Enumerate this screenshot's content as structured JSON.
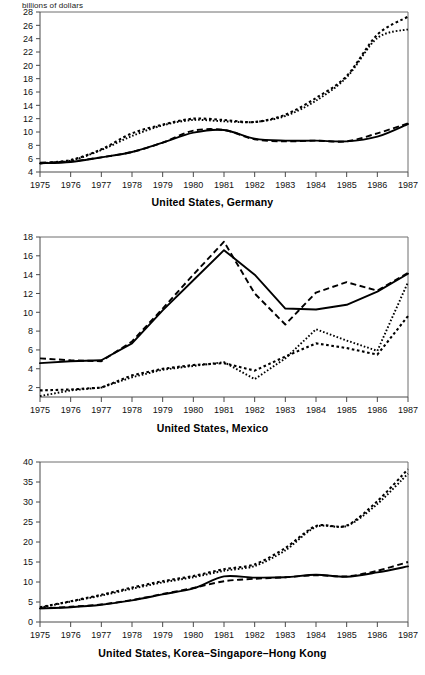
{
  "figure": {
    "unit_label": "billions of dollars",
    "x_axis_label": "",
    "years": [
      1975,
      1976,
      1977,
      1978,
      1979,
      1980,
      1981,
      1982,
      1983,
      1984,
      1985,
      1986,
      1987
    ]
  },
  "chart_data": [
    {
      "type": "line",
      "title": "United States, Germany",
      "xlabel": "",
      "ylabel": "billions of dollars",
      "x": [
        1975,
        1976,
        1977,
        1978,
        1979,
        1980,
        1981,
        1982,
        1983,
        1984,
        1985,
        1986,
        1987
      ],
      "xlim": [
        1975,
        1987
      ],
      "ylim": [
        4,
        28
      ],
      "yticks": [
        4,
        6,
        8,
        10,
        12,
        14,
        16,
        18,
        20,
        22,
        24,
        26,
        28
      ],
      "xticks": [
        1975,
        1976,
        1977,
        1978,
        1979,
        1980,
        1981,
        1982,
        1983,
        1984,
        1985,
        1986,
        1987
      ],
      "grid": false,
      "legend": "none",
      "series": [
        {
          "name": "series-solid",
          "style": "solid",
          "values": [
            5.3,
            5.5,
            6.2,
            7.0,
            8.4,
            9.9,
            10.3,
            9.0,
            8.7,
            8.7,
            8.6,
            9.3,
            11.2
          ]
        },
        {
          "name": "series-dashed",
          "style": "dashed",
          "values": [
            5.4,
            5.6,
            6.2,
            7.0,
            8.4,
            10.2,
            10.3,
            8.9,
            8.6,
            8.7,
            8.6,
            9.8,
            11.3
          ]
        },
        {
          "name": "series-dotted-fine",
          "style": "dotted-fine",
          "values": [
            5.3,
            5.7,
            7.3,
            9.4,
            11.0,
            11.8,
            11.6,
            11.5,
            12.4,
            14.7,
            18.2,
            24.1,
            25.4
          ]
        },
        {
          "name": "series-dotted-coarse",
          "style": "dotted-coarse",
          "values": [
            5.3,
            5.8,
            7.4,
            9.8,
            11.1,
            12.0,
            11.8,
            11.5,
            12.6,
            15.1,
            18.4,
            24.6,
            27.3
          ]
        }
      ]
    },
    {
      "type": "line",
      "title": "United States, Mexico",
      "xlabel": "",
      "ylabel": "billions of dollars",
      "x": [
        1975,
        1976,
        1977,
        1978,
        1979,
        1980,
        1981,
        1982,
        1983,
        1984,
        1985,
        1986,
        1987
      ],
      "xlim": [
        1975,
        1987
      ],
      "ylim": [
        1,
        18
      ],
      "yticks": [
        2,
        4,
        6,
        8,
        10,
        12,
        14,
        16,
        18
      ],
      "xticks": [
        1975,
        1976,
        1977,
        1978,
        1979,
        1980,
        1981,
        1982,
        1983,
        1984,
        1985,
        1986,
        1987
      ],
      "grid": false,
      "legend": "none",
      "series": [
        {
          "name": "series-solid",
          "style": "solid",
          "values": [
            4.6,
            4.8,
            4.9,
            6.7,
            10.2,
            13.4,
            16.6,
            14.0,
            10.4,
            10.3,
            10.8,
            12.2,
            14.1
          ]
        },
        {
          "name": "series-dashed",
          "style": "dashed",
          "values": [
            5.1,
            4.9,
            4.8,
            6.9,
            10.4,
            14.0,
            17.5,
            12.0,
            8.7,
            12.1,
            13.2,
            12.3,
            14.2
          ]
        },
        {
          "name": "series-dotted-fine",
          "style": "dotted-fine",
          "values": [
            1.1,
            1.7,
            2.0,
            3.1,
            3.9,
            4.3,
            4.7,
            2.9,
            5.1,
            8.2,
            7.0,
            5.9,
            13.2
          ]
        },
        {
          "name": "series-dotted-coarse",
          "style": "dotted-coarse",
          "values": [
            1.7,
            1.8,
            2.0,
            3.3,
            4.0,
            4.4,
            4.6,
            3.8,
            5.3,
            6.7,
            6.2,
            5.5,
            9.6
          ]
        }
      ]
    },
    {
      "type": "line",
      "title": "United States, Korea–Singapore–Hong Kong",
      "xlabel": "",
      "ylabel": "billions of dollars",
      "x": [
        1975,
        1976,
        1977,
        1978,
        1979,
        1980,
        1981,
        1982,
        1983,
        1984,
        1985,
        1986,
        1987
      ],
      "xlim": [
        1975,
        1987
      ],
      "ylim": [
        0,
        40
      ],
      "yticks": [
        0,
        5,
        10,
        15,
        20,
        25,
        30,
        35,
        40
      ],
      "xticks": [
        1975,
        1976,
        1977,
        1978,
        1979,
        1980,
        1981,
        1982,
        1983,
        1984,
        1985,
        1986,
        1987
      ],
      "grid": false,
      "legend": "none",
      "series": [
        {
          "name": "series-solid",
          "style": "solid",
          "values": [
            3.4,
            3.7,
            4.3,
            5.4,
            6.9,
            8.4,
            11.4,
            11.1,
            11.2,
            11.8,
            11.3,
            12.4,
            13.9
          ]
        },
        {
          "name": "series-dashed",
          "style": "dashed",
          "values": [
            3.4,
            3.8,
            4.4,
            5.5,
            7.0,
            8.5,
            10.2,
            10.8,
            11.2,
            11.7,
            11.4,
            12.8,
            15.0
          ]
        },
        {
          "name": "series-dotted-fine",
          "style": "dotted-fine",
          "values": [
            3.6,
            5.1,
            6.6,
            8.3,
            9.9,
            11.2,
            12.8,
            14.0,
            17.9,
            23.8,
            24.0,
            29.5,
            37.1
          ]
        },
        {
          "name": "series-dotted-coarse",
          "style": "dotted-coarse",
          "values": [
            3.7,
            5.2,
            6.8,
            8.6,
            10.2,
            11.5,
            13.2,
            14.4,
            18.5,
            24.0,
            24.1,
            30.2,
            38.2
          ]
        }
      ]
    }
  ]
}
